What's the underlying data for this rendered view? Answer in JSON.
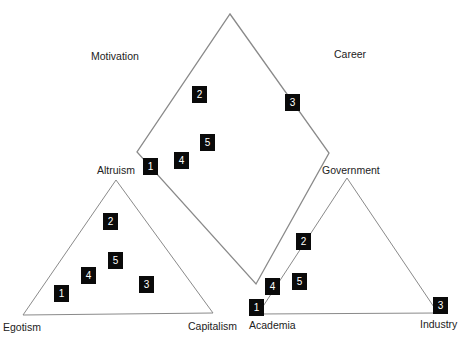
{
  "diagram": {
    "line_color": "#8a8a8a",
    "box_color": "#0a0a0a",
    "diamond": {
      "left_label": "Motivation",
      "right_label": "Career",
      "markers": [
        {
          "id": "2",
          "x": 192,
          "y": 86
        },
        {
          "id": "5",
          "x": 200,
          "y": 134
        },
        {
          "id": "4",
          "x": 174,
          "y": 152
        },
        {
          "id": "1",
          "x": 143,
          "y": 158
        },
        {
          "id": "3",
          "x": 285,
          "y": 94
        }
      ]
    },
    "motivation_triangle": {
      "top_label": "Altruism",
      "bottom_left_label": "Egotism",
      "bottom_right_label": "Capitalism",
      "markers": [
        {
          "id": "2",
          "x": 103,
          "y": 213
        },
        {
          "id": "5",
          "x": 108,
          "y": 252
        },
        {
          "id": "4",
          "x": 81,
          "y": 267
        },
        {
          "id": "1",
          "x": 54,
          "y": 285
        },
        {
          "id": "3",
          "x": 139,
          "y": 276
        }
      ]
    },
    "career_triangle": {
      "top_label": "Government",
      "bottom_left_label": "Academia",
      "bottom_right_label": "Industry",
      "markers": [
        {
          "id": "2",
          "x": 296,
          "y": 233
        },
        {
          "id": "4",
          "x": 265,
          "y": 278
        },
        {
          "id": "5",
          "x": 292,
          "y": 273
        },
        {
          "id": "1",
          "x": 249,
          "y": 299
        },
        {
          "id": "3",
          "x": 433,
          "y": 297
        }
      ]
    }
  }
}
